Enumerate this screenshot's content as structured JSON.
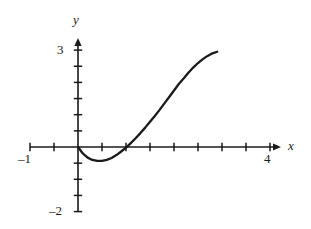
{
  "figure": {
    "name": "coordinate-plane-curve-graph",
    "background_color": "#ffffff",
    "ink_color": "#1a1a1a"
  },
  "labels": {
    "x_axis": "x",
    "y_axis": "y",
    "x_min_tick": "–1",
    "x_max_tick": "4",
    "y_max_tick": "3",
    "y_min_tick": "–2"
  },
  "chart_data": {
    "type": "line",
    "title": "",
    "xlabel": "x",
    "ylabel": "y",
    "xlim": [
      -1.0,
      4.0
    ],
    "ylim": [
      -2.0,
      3.0
    ],
    "grid": false,
    "legend": "none",
    "x_axis": {
      "label": "x",
      "tick_step": 0.5,
      "labeled_ticks": [
        {
          "value": -1,
          "text": "–1"
        },
        {
          "value": 4,
          "text": "4"
        }
      ],
      "ticks": [
        -1,
        -0.5,
        0,
        0.5,
        1,
        1.5,
        2,
        2.5,
        3,
        3.5,
        4
      ],
      "arrow": "right"
    },
    "y_axis": {
      "label": "y",
      "tick_step": 0.5,
      "labeled_ticks": [
        {
          "value": 3,
          "text": "3"
        },
        {
          "value": -2,
          "text": "–2"
        }
      ],
      "ticks": [
        -2,
        -1.5,
        -1,
        -0.5,
        0,
        0.5,
        1,
        1.5,
        2,
        2.5,
        3
      ],
      "arrow": "up"
    },
    "series": [
      {
        "name": "curve",
        "style": "solid",
        "color": "#1a1a1a",
        "x_start": 0.0,
        "x_end": 2.9,
        "x_intercepts": [
          0.0,
          1.15
        ],
        "minimum": {
          "x": 0.55,
          "y": -0.43
        },
        "end_point": {
          "x": 2.9,
          "y": 2.95
        },
        "x": [
          0.0,
          0.1,
          0.2,
          0.3,
          0.4,
          0.5,
          0.6,
          0.7,
          0.8,
          0.9,
          1.0,
          1.1,
          1.2,
          1.3,
          1.4,
          1.5,
          1.6,
          1.7,
          1.8,
          1.9,
          2.0,
          2.1,
          2.2,
          2.3,
          2.4,
          2.5,
          2.6,
          2.7,
          2.8,
          2.9
        ],
        "y": [
          0.0,
          -0.2,
          -0.33,
          -0.4,
          -0.43,
          -0.43,
          -0.4,
          -0.34,
          -0.25,
          -0.14,
          -0.02,
          0.12,
          0.27,
          0.43,
          0.6,
          0.78,
          0.96,
          1.15,
          1.35,
          1.55,
          1.75,
          1.95,
          2.12,
          2.3,
          2.46,
          2.6,
          2.72,
          2.82,
          2.9,
          2.95
        ]
      }
    ]
  }
}
